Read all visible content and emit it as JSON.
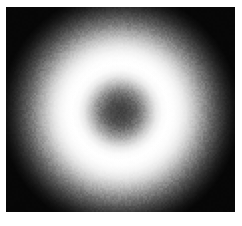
{
  "figure": {
    "kind": "grayscale-raster-image",
    "canvas": {
      "width_px": 242,
      "height_px": 226,
      "background_color": "#ffffff",
      "margin_left_px": 6,
      "margin_top_px": 7,
      "margin_right_px": 7,
      "margin_bottom_px": 14
    },
    "field": {
      "width_px": 229,
      "height_px": 205,
      "base_color": "#000000"
    },
    "colors": {
      "background": "#ffffff",
      "field_black": "#000000",
      "peak_white": "#ffffff",
      "core_gray": "#8a8a8a",
      "mid_gray": "#b8b8b8",
      "outer_black": "#050505"
    },
    "noise": {
      "present": true,
      "type": "dither-grain",
      "opacity": 0.085,
      "cell_px": 2
    }
  },
  "chart_data": {
    "type": "heatmap",
    "subtitle": "",
    "xlabel": "",
    "ylabel": "",
    "colormap": "gray",
    "grid": false,
    "legend": "none",
    "axis_visible": false,
    "tick_labels_x": [],
    "tick_labels_y": [],
    "xlim": [
      0,
      229
    ],
    "ylim": [
      0,
      205
    ],
    "symmetry": "radial",
    "center_px": {
      "x": 114,
      "y": 105
    },
    "annotations": [],
    "radial_profile": {
      "xlabel": "radius (px)",
      "ylabel": "intensity (0-255)",
      "radius_px": [
        0,
        6,
        12,
        18,
        24,
        30,
        36,
        42,
        48,
        54,
        60,
        66,
        72,
        78,
        84,
        90,
        96,
        102,
        108,
        114,
        120
      ],
      "intensity": [
        128,
        133,
        146,
        168,
        196,
        224,
        244,
        253,
        255,
        253,
        245,
        230,
        206,
        176,
        143,
        110,
        80,
        54,
        32,
        16,
        6
      ],
      "features": [
        {
          "name": "center-dip",
          "radius_px": 0,
          "intensity": 128
        },
        {
          "name": "peak-annulus",
          "radius_px": 48,
          "intensity": 255
        },
        {
          "name": "half-max-falloff",
          "radius_px": 86,
          "intensity": 128
        },
        {
          "name": "outer-black",
          "radius_px": 120,
          "intensity": 6
        }
      ]
    }
  }
}
